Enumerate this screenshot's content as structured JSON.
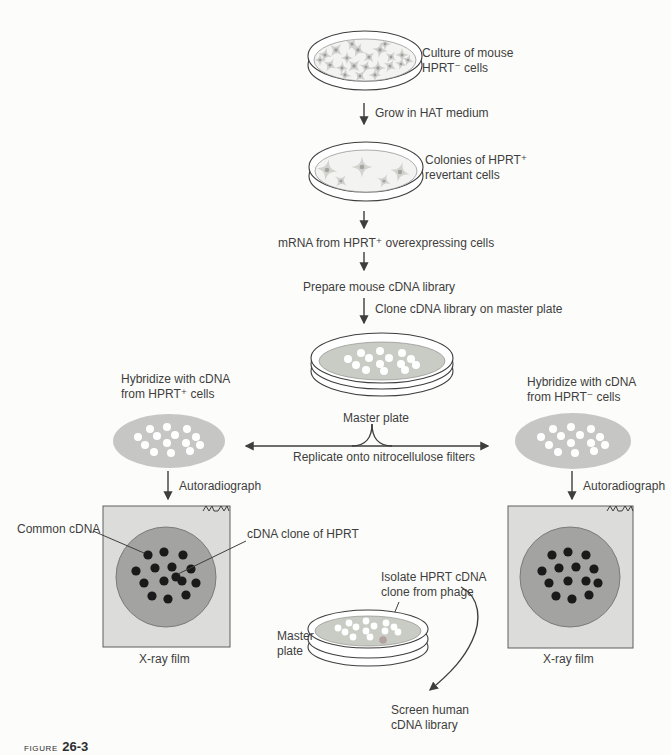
{
  "figure_caption": {
    "prefix": "FIGURE",
    "number": "26-3"
  },
  "labels": {
    "culture_line1": "Culture of mouse",
    "culture_line2": "HPRT⁻ cells",
    "grow_hat": "Grow in HAT medium",
    "colonies_line1": "Colonies of HPRT⁺",
    "colonies_line2": "revertant cells",
    "mrna": "mRNA from HPRT⁺ overexpressing cells",
    "prepare": "Prepare mouse cDNA library",
    "clone": "Clone cDNA library on master plate",
    "master_plate_top": "Master plate",
    "replicate": "Replicate onto nitrocellulose filters",
    "hyb_left_line1": "Hybridize with cDNA",
    "hyb_left_line2": "from HPRT⁺ cells",
    "hyb_right_line1": "Hybridize with cDNA",
    "hyb_right_line2": "from HPRT⁻ cells",
    "autoradiograph_left": "Autoradiograph",
    "autoradiograph_right": "Autoradiograph",
    "common_cdna": "Common cDNA",
    "cdna_clone": "cDNA clone of HPRT",
    "xray_left": "X-ray film",
    "xray_right": "X-ray film",
    "master_bottom_line1": "Master",
    "master_bottom_line2": "plate",
    "isolate_line1": "Isolate HPRT cDNA",
    "isolate_line2": "clone from phage",
    "screen_line1": "Screen human",
    "screen_line2": "cDNA library"
  },
  "colors": {
    "ink": "#3e3e3e",
    "agar": "#c9ccc4",
    "filter_gray": "#c6c6c5",
    "film_background": "#dcdcda",
    "film_circle": "#a3a3a1",
    "signal_dot": "#1a1a1a",
    "colony_white": "#ffffff",
    "picked_clone_pink": "#b2a29f",
    "cell_gray": "#cfcfcc"
  },
  "dots": {
    "cells_dense": {
      "shape": "star",
      "fill": "cell_gray",
      "center_fill": "#9c9c9a",
      "points": [
        [
          325,
          55,
          15,
          0.9
        ],
        [
          336,
          50,
          40,
          1
        ],
        [
          347,
          58,
          0,
          0.85
        ],
        [
          358,
          50,
          25,
          1
        ],
        [
          369,
          57,
          50,
          0.9
        ],
        [
          380,
          50,
          10,
          1
        ],
        [
          391,
          57,
          35,
          0.85
        ],
        [
          402,
          55,
          0,
          0.9
        ],
        [
          330,
          65,
          30,
          0.95
        ],
        [
          342,
          68,
          5,
          0.85
        ],
        [
          354,
          66,
          45,
          1
        ],
        [
          366,
          67,
          20,
          0.9
        ],
        [
          378,
          68,
          0,
          1
        ],
        [
          390,
          66,
          30,
          0.9
        ],
        [
          401,
          64,
          15,
          0.8
        ],
        [
          345,
          75,
          10,
          0.85
        ],
        [
          360,
          76,
          40,
          0.9
        ],
        [
          375,
          75,
          0,
          0.85
        ],
        [
          320,
          60,
          0,
          0.8
        ],
        [
          408,
          60,
          20,
          0.8
        ],
        [
          352,
          44,
          30,
          0.9
        ],
        [
          385,
          44,
          0,
          0.85
        ]
      ]
    },
    "cells_colonies": {
      "shape": "star",
      "fill": "#d2d2cf",
      "center_fill": "#a3a3a0",
      "points": [
        [
          327,
          170,
          10,
          1.35
        ],
        [
          341,
          181,
          40,
          0.95
        ],
        [
          362,
          167,
          0,
          1.35
        ],
        [
          384,
          181,
          25,
          0.95
        ],
        [
          400,
          172,
          15,
          1.3
        ]
      ]
    },
    "master_top": {
      "fill": "colony_white",
      "r": 4,
      "points": [
        [
          361,
          353
        ],
        [
          380,
          351
        ],
        [
          402,
          353
        ],
        [
          348,
          359
        ],
        [
          369,
          358
        ],
        [
          389,
          358
        ],
        [
          411,
          359
        ],
        [
          356,
          365
        ],
        [
          380,
          364
        ],
        [
          401,
          364
        ],
        [
          416,
          365
        ],
        [
          366,
          370
        ],
        [
          384,
          371
        ],
        [
          405,
          370
        ]
      ]
    },
    "filter_left": {
      "fill": "colony_white",
      "r": 4,
      "points": [
        [
          150,
          429
        ],
        [
          167,
          427
        ],
        [
          187,
          429
        ],
        [
          138,
          437
        ],
        [
          157,
          436
        ],
        [
          175,
          435
        ],
        [
          196,
          437
        ],
        [
          145,
          445
        ],
        [
          167,
          443
        ],
        [
          186,
          443
        ],
        [
          200,
          445
        ],
        [
          154,
          452
        ],
        [
          171,
          453
        ],
        [
          190,
          451
        ]
      ]
    },
    "filter_right": {
      "fill": "colony_white",
      "r": 4,
      "points": [
        [
          553,
          429
        ],
        [
          571,
          427
        ],
        [
          591,
          429
        ],
        [
          541,
          437
        ],
        [
          561,
          436
        ],
        [
          580,
          435
        ],
        [
          600,
          437
        ],
        [
          549,
          445
        ],
        [
          571,
          443
        ],
        [
          591,
          443
        ],
        [
          605,
          445
        ],
        [
          558,
          452
        ],
        [
          575,
          453
        ],
        [
          594,
          451
        ]
      ]
    },
    "film_left": {
      "fill": "signal_dot",
      "r": 4.6,
      "points": [
        [
          148,
          555
        ],
        [
          164,
          552
        ],
        [
          183,
          555
        ],
        [
          136,
          571
        ],
        [
          155,
          568
        ],
        [
          172,
          567
        ],
        [
          191,
          569
        ],
        [
          144,
          583
        ],
        [
          164,
          581
        ],
        [
          182,
          581
        ],
        [
          196,
          583
        ],
        [
          152,
          596
        ],
        [
          168,
          599
        ],
        [
          186,
          595
        ],
        [
          176,
          577
        ]
      ]
    },
    "film_right": {
      "fill": "signal_dot",
      "r": 4.6,
      "points": [
        [
          552,
          555
        ],
        [
          568,
          552
        ],
        [
          586,
          555
        ],
        [
          542,
          571
        ],
        [
          559,
          568
        ],
        [
          576,
          567
        ],
        [
          594,
          569
        ],
        [
          549,
          583
        ],
        [
          568,
          581
        ],
        [
          586,
          581
        ],
        [
          598,
          583
        ],
        [
          556,
          596
        ],
        [
          572,
          599
        ],
        [
          589,
          595
        ]
      ]
    },
    "master_bottom": {
      "fill": "colony_white",
      "r": 3.4,
      "points": [
        [
          349,
          623
        ],
        [
          366,
          621
        ],
        [
          386,
          623
        ],
        [
          338,
          628
        ],
        [
          356,
          627
        ],
        [
          374,
          626
        ],
        [
          394,
          627
        ],
        [
          345,
          632
        ],
        [
          366,
          631
        ],
        [
          385,
          631
        ],
        [
          398,
          632
        ],
        [
          353,
          637
        ],
        [
          370,
          637
        ]
      ]
    },
    "picked_clone": {
      "fill": "picked_clone_pink",
      "r": 3.8,
      "points": [
        [
          383,
          640
        ]
      ]
    }
  }
}
